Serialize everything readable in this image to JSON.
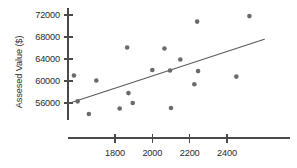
{
  "chart_data": {
    "type": "scatter",
    "title": "",
    "xlabel": "",
    "ylabel": "Assesed Value ($)",
    "grid": false,
    "legend": null,
    "xlim": [
      1550,
      2620
    ],
    "ylim": [
      53200,
      73400
    ],
    "xticks": [
      1800,
      2000,
      2200,
      2400
    ],
    "xtick_labels": [
      "1800",
      "2000",
      "2200",
      "2400"
    ],
    "yticks": [
      56000,
      60000,
      64000,
      68000,
      72000
    ],
    "ytick_labels": [
      "56000",
      "60000",
      "64000",
      "68000",
      "72000"
    ],
    "point_color": "#6b6b6b",
    "line_color": "#5a5a5a",
    "axis_color": "#4a4a4a",
    "background_color": "#ffffff",
    "points": [
      {
        "x": 1580,
        "y": 61000
      },
      {
        "x": 1600,
        "y": 56300
      },
      {
        "x": 1660,
        "y": 54000
      },
      {
        "x": 1700,
        "y": 60100
      },
      {
        "x": 1825,
        "y": 55000
      },
      {
        "x": 1865,
        "y": 66100
      },
      {
        "x": 1872,
        "y": 57800
      },
      {
        "x": 1895,
        "y": 56000
      },
      {
        "x": 2000,
        "y": 62000
      },
      {
        "x": 2065,
        "y": 65900
      },
      {
        "x": 2095,
        "y": 61900
      },
      {
        "x": 2100,
        "y": 55100
      },
      {
        "x": 2150,
        "y": 63900
      },
      {
        "x": 2225,
        "y": 59400
      },
      {
        "x": 2240,
        "y": 70800
      },
      {
        "x": 2245,
        "y": 61800
      },
      {
        "x": 2450,
        "y": 60800
      },
      {
        "x": 2520,
        "y": 71800
      }
    ],
    "trend_line": {
      "x1": 1550,
      "y1": 55900,
      "x2": 2600,
      "y2": 67600
    }
  }
}
